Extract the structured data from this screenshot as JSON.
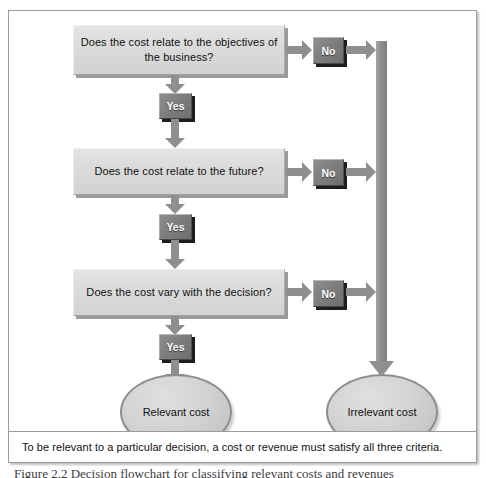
{
  "figure": {
    "caption_note": "To be relevant to a particular decision, a cost or revenue must satisfy all three criteria.",
    "below_caption": "Figure 2.2 Decision flowchart for classifying relevant costs and revenues"
  },
  "decisions": [
    {
      "id": "objectives",
      "question": "Does the cost relate to the objectives of the business?"
    },
    {
      "id": "future",
      "question": "Does the cost relate to the future?"
    },
    {
      "id": "vary",
      "question": "Does the cost vary with the decision?"
    }
  ],
  "branches": {
    "yes_label": "Yes",
    "no_label": "No"
  },
  "outcomes": {
    "relevant": "Relevant cost",
    "irrelevant": "Irrelevant cost"
  },
  "icons": {
    "arrow_down": "arrow-down-icon",
    "arrow_right": "arrow-right-icon"
  },
  "colors": {
    "box_fill": "#dcdcdc",
    "box_shadow": "#9a9a9a",
    "label_fill": "#7e7e7e",
    "label_text": "#ffffff",
    "arrow_fill": "#8f8f8f",
    "frame_border": "#9b9b9b",
    "ellipse_fill": "#d3d3d3",
    "ellipse_border": "#8d8d8d"
  }
}
